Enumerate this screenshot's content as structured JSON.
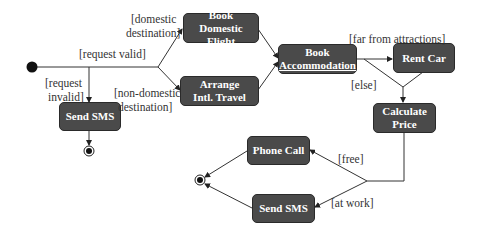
{
  "diagram": {
    "type": "UML activity diagram",
    "colors": {
      "node_fill": "#4a4a4a",
      "node_text": "#ffffff",
      "line": "#333333",
      "background": "#ffffff"
    },
    "nodes": {
      "book_domestic_flight": {
        "line1": "Book",
        "line2": "Domestic Flight"
      },
      "arrange_intl_travel": {
        "line1": "Arrange",
        "line2": "Intl. Travel"
      },
      "book_accommodation": {
        "line1": "Book",
        "line2": "Accommodation"
      },
      "rent_car": {
        "line1": "Rent Car"
      },
      "calculate_price": {
        "line1": "Calculate",
        "line2": "Price"
      },
      "send_sms_left": {
        "line1": "Send SMS"
      },
      "phone_call": {
        "line1": "Phone Call"
      },
      "send_sms_bottom": {
        "line1": "Send SMS"
      }
    },
    "guards": {
      "domestic_l1": "[domestic",
      "domestic_l2": "destination]",
      "request_valid": "[request valid]",
      "request_invalid_l1": "[request",
      "request_invalid_l2": "invalid]",
      "non_domestic_l1": "[non-domestic",
      "non_domestic_l2": "destination]",
      "far_from_attractions": "[far from attractions]",
      "else": "[else]",
      "free": "[free]",
      "at_work": "[at work]"
    }
  }
}
